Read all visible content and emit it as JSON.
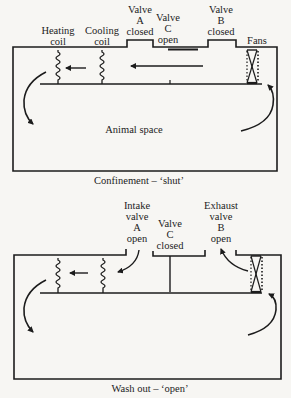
{
  "colors": {
    "ink": "#1c1c1c",
    "paper": "#f7f6f3"
  },
  "panels": [
    {
      "id": "confinement",
      "caption": "Confinement – ‘shut’",
      "labels": {
        "heating_coil": "Heating\ncoil",
        "cooling_coil": "Cooling\ncoil",
        "valve_a": "Valve\nA\nclosed",
        "valve_c": "Valve\nC\nopen",
        "valve_b": "Valve\nB\nclosed",
        "fans": "Fans",
        "animal_space": "Animal space"
      },
      "valves": {
        "A": "closed",
        "B": "closed",
        "C": "open"
      }
    },
    {
      "id": "wash-out",
      "caption": "Wash out – ‘open’",
      "labels": {
        "valve_a": "Intake\nvalve\nA\nopen",
        "valve_c": "Valve\nC\nclosed",
        "valve_b": "Exhaust\nvalve\nB\nopen"
      },
      "valves": {
        "A": "open",
        "B": "open",
        "C": "closed"
      }
    }
  ]
}
